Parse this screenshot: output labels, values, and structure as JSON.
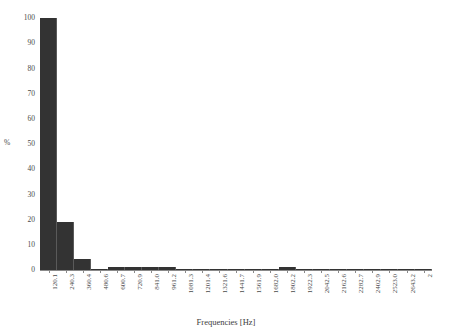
{
  "chart_data": {
    "type": "bar",
    "title": "",
    "subtitle": "",
    "xlabel": "Frequencies [Hz]",
    "ylabel": "%",
    "grid": false,
    "legend": null,
    "ylim": [
      0,
      100
    ],
    "ytick_labels": [
      "100",
      "90",
      "80",
      "70",
      "60",
      "50",
      "40",
      "30",
      "20",
      "10",
      "0"
    ],
    "ytick_values": [
      100,
      90,
      80,
      70,
      60,
      50,
      40,
      30,
      20,
      10,
      0
    ],
    "categories": [
      "120.1",
      "240.3",
      "360.4",
      "480.6",
      "600.7",
      "720.9",
      "841.0",
      "961.2",
      "1081.3",
      "1201.4",
      "1321.6",
      "1441.7",
      "1561.9",
      "1682.0",
      "1802.2",
      "1922.3",
      "2042.5",
      "2162.6",
      "2282.7",
      "2402.9",
      "2523.0",
      "2643.2",
      "2"
    ],
    "values": [
      100,
      19,
      4.5,
      0.4,
      1.2,
      1.2,
      1.2,
      1.2,
      0.4,
      0.4,
      0.4,
      0.4,
      0.4,
      0.4,
      1.1,
      0.3,
      0.3,
      0.3,
      0.3,
      0.3,
      0.3,
      0.3,
      0.3
    ],
    "bar_color": "#333333",
    "axis_color": "#8a8a8a",
    "background_color": "#ffffff"
  }
}
